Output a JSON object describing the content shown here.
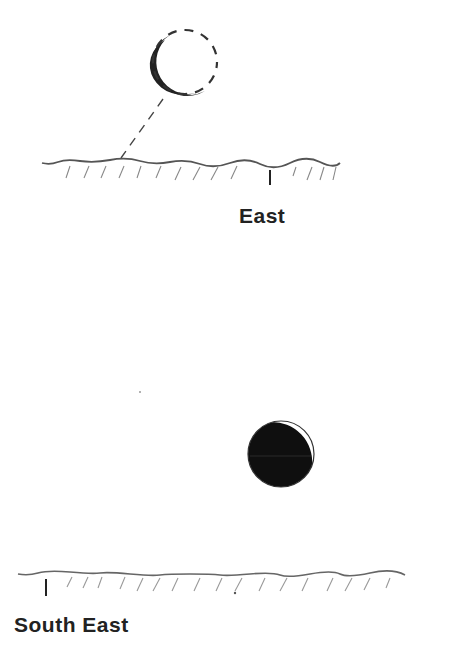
{
  "diagram": {
    "type": "moon-phase-sketches",
    "panels": [
      {
        "id": "east",
        "direction_label": "East",
        "moon": {
          "phase": "thin crescent (lit limb lower-left)",
          "center": [
            185,
            62
          ],
          "radius": 32,
          "outline": "dashed on unlit side"
        },
        "pointer_line": "dashed line from moon to horizon",
        "horizon_marker_x": 270
      },
      {
        "id": "south-east",
        "direction_label": "South East",
        "moon": {
          "phase": "mostly dark with thin bright crescent upper-right",
          "center": [
            281,
            454
          ],
          "radius": 33
        },
        "horizon_marker_x": 46
      }
    ]
  },
  "colors": {
    "background": "#ffffff",
    "ink": "#222222",
    "hatch": "#888888",
    "moon_dark": "#111111"
  }
}
